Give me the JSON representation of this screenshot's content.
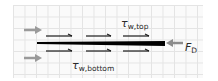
{
  "diagram": {
    "labels": {
      "shear_top_symbol": "τ",
      "shear_top_subscript": "w,top",
      "shear_bottom_symbol": "τ",
      "shear_bottom_subscript": "w,bottom",
      "drag_symbol": "F",
      "drag_subscript": "D"
    },
    "elements": {
      "incoming_flow_arrows": 2,
      "shear_arrows_top": 3,
      "shear_arrows_bottom": 3,
      "plate": "thin black flat plate"
    },
    "colors": {
      "plate": "#000000",
      "flow_arrow": "#9a9a9a",
      "shear_arrow": "#1a1a1a",
      "drag_arrow": "#8c8c8c",
      "grid": "#e4e4e4",
      "text": "#2a2a2a"
    }
  }
}
